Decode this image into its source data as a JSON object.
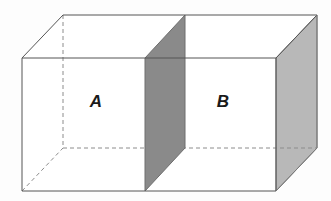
{
  "figure": {
    "name": "partitioned-rectangular-box-diagram",
    "background_color": "#fdfdfd",
    "colors": {
      "edge_visible": "#555555",
      "edge_hidden": "#8c8c8c",
      "partition_fill": "#8a8a8a",
      "partition_stroke": "#6e6e6e",
      "side_face_fill": "#b8b8b8",
      "side_face_stroke": "#7a7a7a",
      "front_face_fill": "#ffffff",
      "label_color": "#1a1a1a"
    },
    "geometry": {
      "front_top_left": [
        22,
        58
      ],
      "front_top_right": [
        276,
        58
      ],
      "front_bottom_left": [
        22,
        191
      ],
      "front_bottom_right": [
        276,
        191
      ],
      "back_top_left": [
        63,
        15
      ],
      "back_top_right": [
        317,
        15
      ],
      "back_bottom_left": [
        63,
        148
      ],
      "back_bottom_right": [
        317,
        148
      ],
      "partition_front_top": [
        145,
        58
      ],
      "partition_front_bottom": [
        145,
        191
      ],
      "partition_back_top": [
        185,
        15
      ],
      "partition_back_bottom": [
        185,
        148
      ]
    },
    "labels": [
      {
        "id": "label-a",
        "text": "A",
        "x": 96,
        "y": 103
      },
      {
        "id": "label-b",
        "text": "B",
        "x": 223,
        "y": 103
      }
    ]
  }
}
